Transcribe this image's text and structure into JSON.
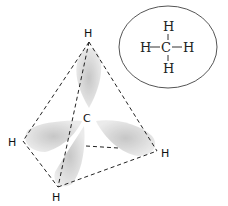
{
  "diagram": {
    "central_atom": "C",
    "vertices": [
      {
        "id": "top",
        "label": "H"
      },
      {
        "id": "left",
        "label": "H"
      },
      {
        "id": "bottom",
        "label": "H"
      },
      {
        "id": "right",
        "label": "H"
      }
    ],
    "structural_formula": {
      "center": "C",
      "top": "H",
      "bottom": "H",
      "left": "H",
      "right": "H",
      "bond": "—"
    }
  }
}
